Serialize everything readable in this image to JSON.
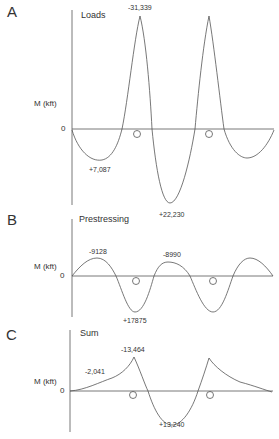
{
  "panels": [
    {
      "letter": "A",
      "title": "Loads",
      "ylabel": "M (kft)",
      "zero": "0",
      "annotations": [
        "-31,339",
        "+7,087",
        "+22,230"
      ]
    },
    {
      "letter": "B",
      "title": "Prestressing",
      "ylabel": "M (kft)",
      "zero": "0",
      "annotations": [
        "-9128",
        "-8990",
        "+17875"
      ]
    },
    {
      "letter": "C",
      "title": "Sum",
      "ylabel": "M (kft)",
      "zero": "0",
      "annotations": [
        "-13,464",
        "-2,041",
        "+13,240"
      ]
    }
  ],
  "colors": {
    "line": "#555555",
    "text": "#333333",
    "background": "#ffffff"
  }
}
